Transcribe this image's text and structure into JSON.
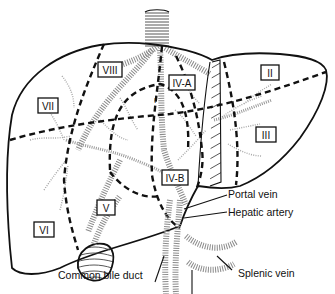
{
  "segments": {
    "s2": "II",
    "s3": "III",
    "s4a": "IV-A",
    "s4b": "IV-B",
    "s5": "V",
    "s6": "VI",
    "s7": "VII",
    "s8": "VIII",
    "s1": "I"
  },
  "callouts": {
    "portal_vein": "Portal vein",
    "hepatic_artery": "Hepatic artery",
    "common_bile_duct": "Common bile duct",
    "splenic_vein": "Splenic vein"
  }
}
